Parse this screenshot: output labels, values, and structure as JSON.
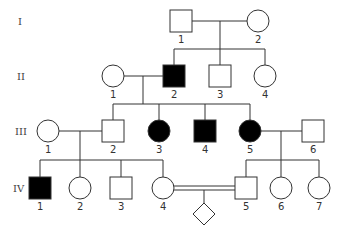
{
  "colors": {
    "affected": "#000000",
    "unaffected": "#ffffff",
    "line": "#333333"
  },
  "generations": [
    {
      "label": "I",
      "y": 21
    },
    {
      "label": "II",
      "y": 76
    },
    {
      "label": "III",
      "y": 131
    },
    {
      "label": "IV",
      "y": 188
    }
  ],
  "individuals": [
    {
      "id": "I-1",
      "gen": "I",
      "num": "1",
      "sex": "male",
      "affected": false,
      "cx": 181,
      "cy": 21
    },
    {
      "id": "I-2",
      "gen": "I",
      "num": "2",
      "sex": "female",
      "affected": false,
      "cx": 258,
      "cy": 21
    },
    {
      "id": "II-1",
      "gen": "II",
      "num": "1",
      "sex": "female",
      "affected": false,
      "cx": 113,
      "cy": 76
    },
    {
      "id": "II-2",
      "gen": "II",
      "num": "2",
      "sex": "male",
      "affected": true,
      "cx": 174,
      "cy": 76
    },
    {
      "id": "II-3",
      "gen": "II",
      "num": "3",
      "sex": "male",
      "affected": false,
      "cx": 220,
      "cy": 76
    },
    {
      "id": "II-4",
      "gen": "II",
      "num": "4",
      "sex": "female",
      "affected": false,
      "cx": 265,
      "cy": 76
    },
    {
      "id": "III-1",
      "gen": "III",
      "num": "1",
      "sex": "female",
      "affected": false,
      "cx": 48,
      "cy": 131
    },
    {
      "id": "III-2",
      "gen": "III",
      "num": "2",
      "sex": "male",
      "affected": false,
      "cx": 113,
      "cy": 131
    },
    {
      "id": "III-3",
      "gen": "III",
      "num": "3",
      "sex": "female",
      "affected": true,
      "cx": 159,
      "cy": 131
    },
    {
      "id": "III-4",
      "gen": "III",
      "num": "4",
      "sex": "male",
      "affected": true,
      "cx": 205,
      "cy": 131
    },
    {
      "id": "III-5",
      "gen": "III",
      "num": "5",
      "sex": "female",
      "affected": true,
      "cx": 250,
      "cy": 131
    },
    {
      "id": "III-6",
      "gen": "III",
      "num": "6",
      "sex": "male",
      "affected": false,
      "cx": 313,
      "cy": 131
    },
    {
      "id": "IV-1",
      "gen": "IV",
      "num": "1",
      "sex": "male",
      "affected": true,
      "cx": 40,
      "cy": 188
    },
    {
      "id": "IV-2",
      "gen": "IV",
      "num": "2",
      "sex": "female",
      "affected": false,
      "cx": 80,
      "cy": 188
    },
    {
      "id": "IV-3",
      "gen": "IV",
      "num": "3",
      "sex": "male",
      "affected": false,
      "cx": 121,
      "cy": 188
    },
    {
      "id": "IV-4",
      "gen": "IV",
      "num": "4",
      "sex": "female",
      "affected": false,
      "cx": 163,
      "cy": 188
    },
    {
      "id": "IV-5",
      "gen": "IV",
      "num": "5",
      "sex": "male",
      "affected": false,
      "cx": 246,
      "cy": 188
    },
    {
      "id": "IV-6",
      "gen": "IV",
      "num": "6",
      "sex": "female",
      "affected": false,
      "cx": 281,
      "cy": 188
    },
    {
      "id": "IV-7",
      "gen": "IV",
      "num": "7",
      "sex": "female",
      "affected": false,
      "cx": 319,
      "cy": 188
    },
    {
      "id": "V-?",
      "gen": "V",
      "num": "",
      "sex": "unknown",
      "affected": false,
      "cx": 204,
      "cy": 214
    }
  ],
  "unions": [
    {
      "a": "I-1",
      "b": "I-2",
      "consanguineous": false
    },
    {
      "a": "II-1",
      "b": "II-2",
      "consanguineous": false
    },
    {
      "a": "III-1",
      "b": "III-2",
      "consanguineous": false
    },
    {
      "a": "III-5",
      "b": "III-6",
      "consanguineous": false
    },
    {
      "a": "IV-4",
      "b": "IV-5",
      "consanguineous": true
    }
  ]
}
